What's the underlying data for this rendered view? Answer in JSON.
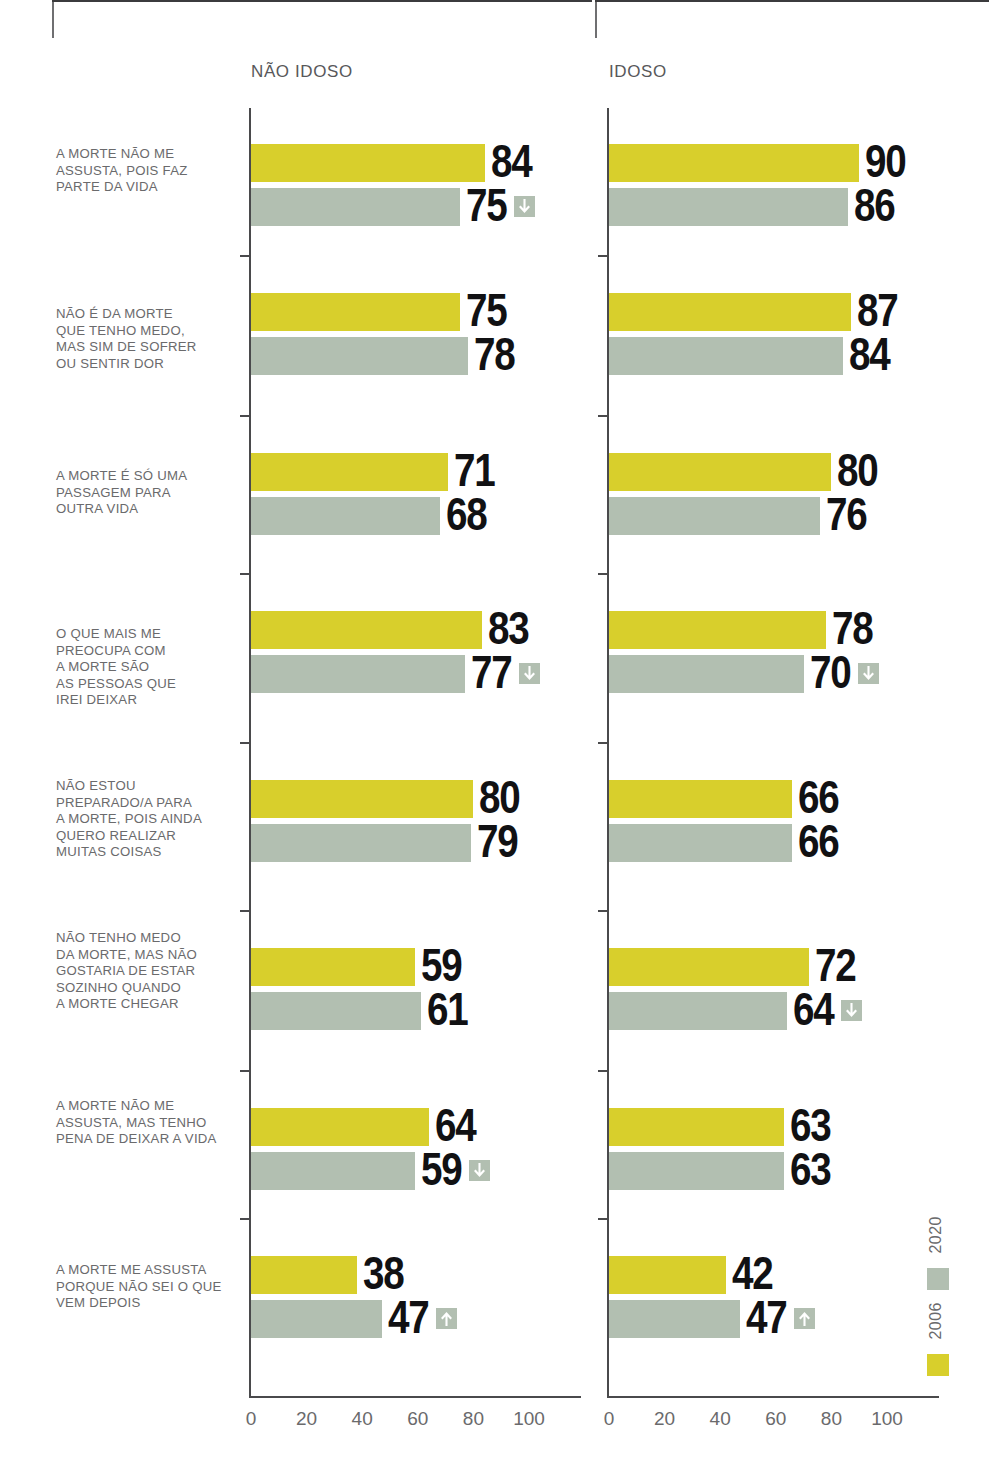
{
  "chart_data": {
    "type": "bar",
    "orientation": "horizontal",
    "title": "",
    "xlabel": "",
    "ylabel": "",
    "xlim": [
      0,
      100
    ],
    "xticks": [
      "0",
      "20",
      "40",
      "60",
      "80",
      "100"
    ],
    "grid": false,
    "legend_position": "bottom-right-vertical",
    "panels": [
      {
        "key": "nao_idoso",
        "label": "NÃO IDOSO"
      },
      {
        "key": "idoso",
        "label": "IDOSO"
      }
    ],
    "series": [
      {
        "name": "2006",
        "color": "#d8cf2c"
      },
      {
        "name": "2020",
        "color": "#b2bfb1"
      }
    ],
    "categories": [
      "A MORTE NÃO ME ASSUSTA, POIS FAZ PARTE DA VIDA",
      "NÃO É DA MORTE QUE TENHO MEDO, MAS SIM DE SOFRER OU SENTIR DOR",
      "A MORTE É SÓ UMA PASSAGEM PARA OUTRA VIDA",
      "O QUE MAIS ME PREOCUPA COM A MORTE SÃO AS PESSOAS QUE IREI DEIXAR",
      "NÃO ESTOU PREPARADO/A PARA A MORTE, POIS AINDA QUERO REALIZAR MUITAS COISAS",
      "NÃO TENHO MEDO DA MORTE, MAS NÃO GOSTARIA DE ESTAR SOZINHO QUANDO A MORTE CHEGAR",
      "A MORTE NÃO ME ASSUSTA, MAS TENHO PENA DE DEIXAR A VIDA",
      "A MORTE ME ASSUSTA PORQUE NÃO SEI O QUE VEM DEPOIS"
    ],
    "nao_idoso": {
      "2006": [
        84,
        75,
        71,
        83,
        80,
        59,
        64,
        38
      ],
      "2020": [
        75,
        78,
        68,
        77,
        79,
        61,
        59,
        47
      ]
    },
    "idoso": {
      "2006": [
        90,
        87,
        80,
        78,
        66,
        72,
        63,
        42
      ],
      "2020": [
        86,
        84,
        76,
        70,
        66,
        64,
        63,
        47
      ]
    },
    "change_markers": {
      "nao_idoso": [
        "down",
        null,
        null,
        "down",
        null,
        null,
        "down",
        "up"
      ],
      "idoso": [
        null,
        null,
        null,
        "down",
        null,
        "down",
        null,
        "up"
      ]
    }
  },
  "rows": [
    {
      "label_lines": [
        "A MORTE NÃO ME",
        "ASSUSTA, POIS FAZ",
        "PARTE DA VIDA"
      ]
    },
    {
      "label_lines": [
        "NÃO É DA MORTE",
        "QUE TENHO MEDO,",
        "MAS SIM DE SOFRER",
        "OU SENTIR DOR"
      ]
    },
    {
      "label_lines": [
        "A MORTE É SÓ UMA",
        "PASSAGEM PARA",
        "OUTRA VIDA"
      ]
    },
    {
      "label_lines": [
        "O QUE MAIS ME",
        "PREOCUPA COM",
        "A MORTE SÃO",
        "AS PESSOAS QUE",
        "IREI DEIXAR"
      ]
    },
    {
      "label_lines": [
        "NÃO ESTOU",
        "PREPARADO/A PARA",
        "A MORTE, POIS AINDA",
        "QUERO REALIZAR",
        "MUITAS COISAS"
      ]
    },
    {
      "label_lines": [
        "NÃO TENHO MEDO",
        "DA MORTE, MAS NÃO",
        "GOSTARIA DE ESTAR",
        "SOZINHO QUANDO",
        "A MORTE CHEGAR"
      ]
    },
    {
      "label_lines": [
        "A MORTE NÃO ME",
        "ASSUSTA, MAS TENHO",
        "PENA DE DEIXAR A VIDA"
      ]
    },
    {
      "label_lines": [
        "A MORTE ME ASSUSTA",
        "PORQUE NÃO SEI O QUE",
        "VEM DEPOIS"
      ]
    }
  ],
  "legend": {
    "items": [
      {
        "label": "2020",
        "color": "#b2bfb1"
      },
      {
        "label": "2006",
        "color": "#d8cf2c"
      }
    ]
  },
  "icons": {
    "down_arrow": "arrow-down-icon",
    "up_arrow": "arrow-up-icon"
  }
}
